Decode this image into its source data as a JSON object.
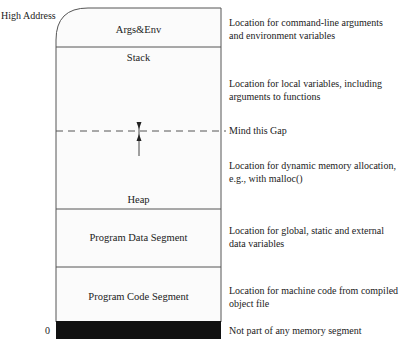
{
  "axis": {
    "high_label": "High Address",
    "low_label": "0"
  },
  "segments": [
    {
      "label": "Args&Env",
      "description_lines": [
        "Location for command-line arguments",
        "and environment variables"
      ]
    },
    {
      "label": "Stack",
      "description_lines": [
        "Location for local variables, including",
        "arguments to functions"
      ]
    },
    {
      "label": "Heap",
      "description_lines": [
        "Location for dynamic memory allocation,",
        "e.g., with malloc()"
      ]
    },
    {
      "label": "Program Data Segment",
      "description_lines": [
        "Location for global, static and external",
        "data variables"
      ]
    },
    {
      "label": "Program Code Segment",
      "description_lines": [
        "Location for machine code from compiled",
        "object file"
      ]
    },
    {
      "label": "",
      "description_lines": [
        "Not part of any memory segment"
      ]
    }
  ],
  "gap": {
    "label": "Mind this Gap"
  },
  "colors": {
    "box_fill": "#fdfdfd",
    "line": "#555555",
    "null_bar": "#111111"
  }
}
